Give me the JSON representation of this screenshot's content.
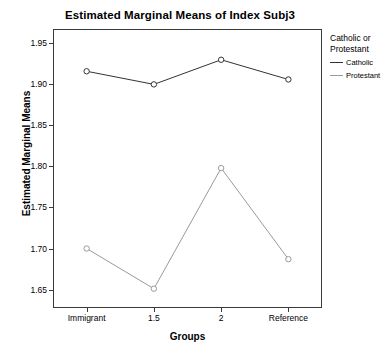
{
  "chart_data": {
    "type": "line",
    "title": "Estimated Marginal Means of Index Subj3",
    "xlabel": "Groups",
    "ylabel": "Estimated Marginal Means",
    "categories": [
      "Immigrant",
      "1.5",
      "2",
      "Reference"
    ],
    "ylim": [
      1.6275,
      1.9675
    ],
    "yticks": [
      "1.65",
      "1.70",
      "1.75",
      "1.80",
      "1.85",
      "1.90",
      "1.95"
    ],
    "ytick_values": [
      1.65,
      1.7,
      1.75,
      1.8,
      1.85,
      1.9,
      1.95
    ],
    "grid": false,
    "legend_position": "right",
    "legend_title": "Catholic or Protestant",
    "series": [
      {
        "name": "Catholic",
        "color": "#333333",
        "marker": "circle",
        "values": [
          1.916,
          1.9,
          1.93,
          1.906
        ]
      },
      {
        "name": "Protestant",
        "color": "#9a9a9a",
        "marker": "circle",
        "values": [
          1.7,
          1.651,
          1.798,
          1.687
        ]
      }
    ]
  },
  "colors": {
    "axis": "#3a3a3a",
    "background": "#ffffff",
    "catholic": "#333333",
    "protestant": "#9a9a9a"
  }
}
